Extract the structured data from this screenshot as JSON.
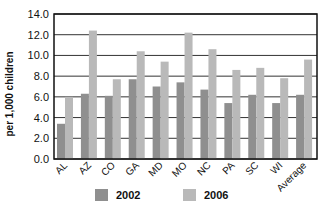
{
  "chart_data": {
    "type": "bar",
    "title": "",
    "xlabel": "",
    "ylabel": "per 1,000 children",
    "ylim": [
      0,
      14
    ],
    "yticks": [
      "0.0",
      "2.0",
      "4.0",
      "6.0",
      "8.0",
      "10.0",
      "12.0",
      "14.0"
    ],
    "grid": true,
    "legend_position": "bottom",
    "categories": [
      "AL",
      "AZ",
      "CO",
      "GA",
      "MD",
      "MO",
      "NC",
      "PA",
      "SC",
      "WI",
      "Average"
    ],
    "series": [
      {
        "name": "2002",
        "color": "#8f8f8f",
        "values": [
          3.4,
          6.3,
          6.1,
          7.7,
          7.0,
          7.4,
          6.7,
          5.4,
          6.2,
          5.4,
          6.2
        ]
      },
      {
        "name": "2006",
        "color": "#b9b9b9",
        "values": [
          6.0,
          12.4,
          7.7,
          10.4,
          9.4,
          12.2,
          10.6,
          8.6,
          8.8,
          7.8,
          9.6
        ]
      }
    ]
  },
  "legend": [
    {
      "label": "2002",
      "color": "#8f8f8f"
    },
    {
      "label": "2006",
      "color": "#b9b9b9"
    }
  ]
}
